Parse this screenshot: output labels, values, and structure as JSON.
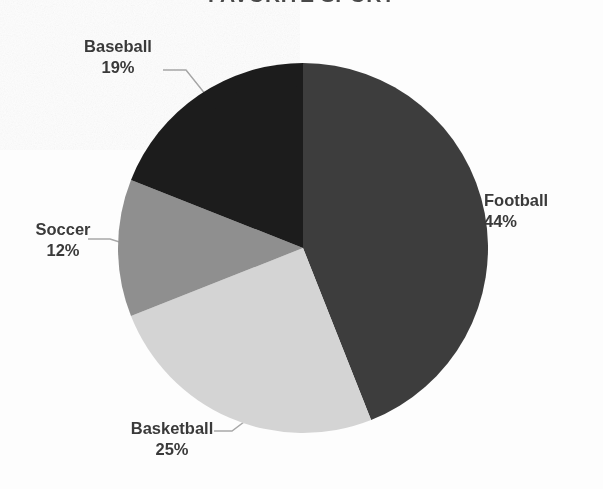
{
  "chart_data": {
    "type": "pie",
    "title": "FAVORITE SPORT",
    "categories": [
      "Football",
      "Basketball",
      "Soccer",
      "Baseball"
    ],
    "values": [
      44,
      25,
      12,
      19
    ],
    "value_suffix": "%",
    "labels": [
      {
        "name": "Football",
        "value": 44,
        "value_text": "44%",
        "color": "#3d3d3d"
      },
      {
        "name": "Basketball",
        "value": 25,
        "value_text": "25%",
        "color": "#d4d4d4"
      },
      {
        "name": "Soccer",
        "value": 12,
        "value_text": "12%",
        "color": "#8f8f8f"
      },
      {
        "name": "Baseball",
        "value": 19,
        "value_text": "19%",
        "color": "#1c1c1c"
      }
    ],
    "start_angle": 0,
    "direction": "clockwise",
    "legend": "none",
    "grid": false,
    "label_position": "outside-with-leader-lines",
    "leader_line_color": "#a8a8a8",
    "background": "#ffffff",
    "label_text_color": "#3a3a3a"
  },
  "slices": {
    "football": {
      "name": "Football",
      "value_text": "44%"
    },
    "basketball": {
      "name": "Basketball",
      "value_text": "25%"
    },
    "soccer": {
      "name": "Soccer",
      "value_text": "12%"
    },
    "baseball": {
      "name": "Baseball",
      "value_text": "19%"
    }
  }
}
